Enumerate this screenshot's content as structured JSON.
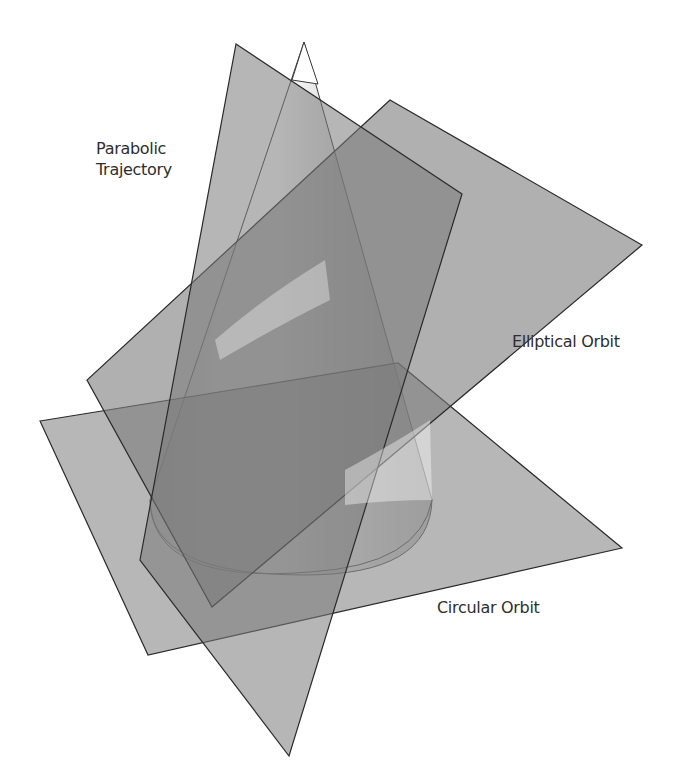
{
  "figure": {
    "colors": {
      "background": "#ffffff",
      "plane_fill": "#8a8a8a",
      "plane_stroke": "#2a2a2a",
      "cone_light": "#ffffff",
      "cone_shade": "#b5b5b5",
      "label_text": "#2e2e2e"
    },
    "labels": {
      "parabolic_line1": "Parabolic",
      "parabolic_line2": "Trajectory",
      "elliptical": "Elliptical Orbit",
      "circular": "Circular Orbit"
    },
    "shapes": [
      {
        "name": "circular-orbit-plane",
        "kind": "plane"
      },
      {
        "name": "elliptical-orbit-plane",
        "kind": "plane"
      },
      {
        "name": "parabolic-trajectory-plane",
        "kind": "plane"
      },
      {
        "name": "cone",
        "kind": "cone"
      }
    ]
  }
}
